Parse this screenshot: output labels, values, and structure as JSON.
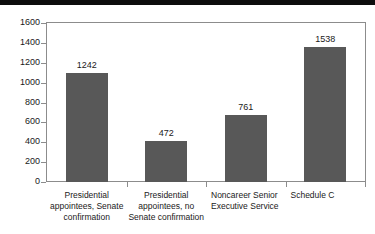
{
  "chart_data": {
    "type": "bar",
    "title": "",
    "subtitle": "",
    "xlabel": "",
    "ylabel": "",
    "ylim": [
      0,
      1600
    ],
    "ytick_step": 200,
    "yticks": [
      1600,
      1400,
      1200,
      1000,
      800,
      600,
      400,
      200,
      0
    ],
    "grid": false,
    "legend": null,
    "bar_color": "#585858",
    "axis_color": "#8c8c8c",
    "text_color": "#1a1a1a",
    "background": "#ffffff",
    "categories": [
      "Presidential appointees, Senate confirmation",
      "Presidential appointees, no Senate confirmation",
      "Noncareer Senior Executive Service",
      "Schedule C"
    ],
    "category_lines": [
      [
        "Presidential",
        "appointees, Senate",
        "confirmation"
      ],
      [
        "Presidential",
        "appointees, no",
        "Senate confirmation"
      ],
      [
        "Noncareer Senior",
        "Executive Service"
      ],
      [
        "Schedule C"
      ]
    ],
    "values": [
      1242,
      472,
      761,
      1538
    ],
    "data_labels": [
      "1242",
      "472",
      "761",
      "1538"
    ]
  },
  "axis": {
    "y_tick_labels": [
      "1600",
      "1400",
      "1200",
      "1000",
      "800",
      "600",
      "400",
      "200",
      "0"
    ]
  }
}
